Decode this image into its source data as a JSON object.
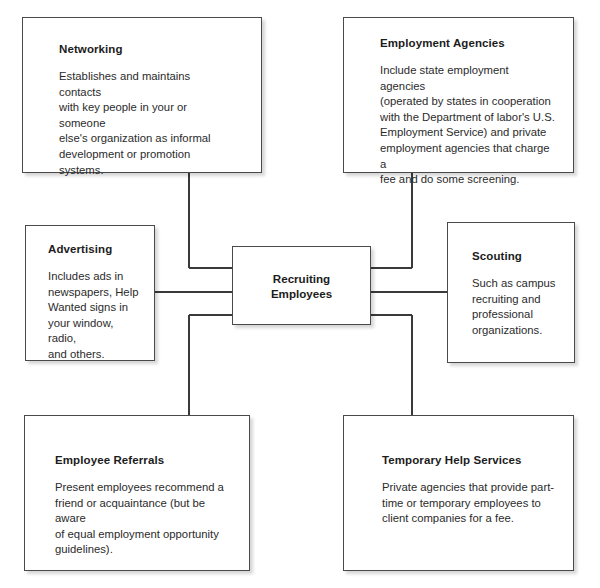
{
  "diagram": {
    "title": "Recruiting Employees",
    "center": {
      "label": "Recruiting\nEmployees"
    },
    "nodes": [
      {
        "id": "networking",
        "title": "Networking",
        "body": "Establishes and maintains contacts\nwith key people in your or someone\nelse's organization as informal\ndevelopment or promotion systems."
      },
      {
        "id": "employment-agencies",
        "title": "Employment Agencies",
        "body": "Include state employment agencies\n(operated by states in cooperation\nwith the Department  of labor's U.S.\nEmployment Service) and private\nemployment agencies that charge a\nfee and do some screening."
      },
      {
        "id": "advertising",
        "title": "Advertising",
        "body": "Includes ads in\nnewspapers, Help\nWanted signs in\nyour window, radio,\nand others."
      },
      {
        "id": "scouting",
        "title": "Scouting",
        "body": "Such as campus\nrecruiting and\nprofessional\norganizations."
      },
      {
        "id": "employee-referrals",
        "title": "Employee Referrals",
        "body": "Present employees recommend a\nfriend or acquaintance (but be aware\nof equal employment opportunity\nguidelines)."
      },
      {
        "id": "temporary-help-services",
        "title": "Temporary Help Services",
        "body": "Private agencies that provide part-\ntime or temporary employees to\nclient companies for a fee."
      }
    ],
    "colors": {
      "border": "#4a4a4a",
      "connector": "#3a3a3a",
      "title_text": "#1c1c1c",
      "body_text": "#2b2b2b",
      "background": "#ffffff"
    }
  }
}
